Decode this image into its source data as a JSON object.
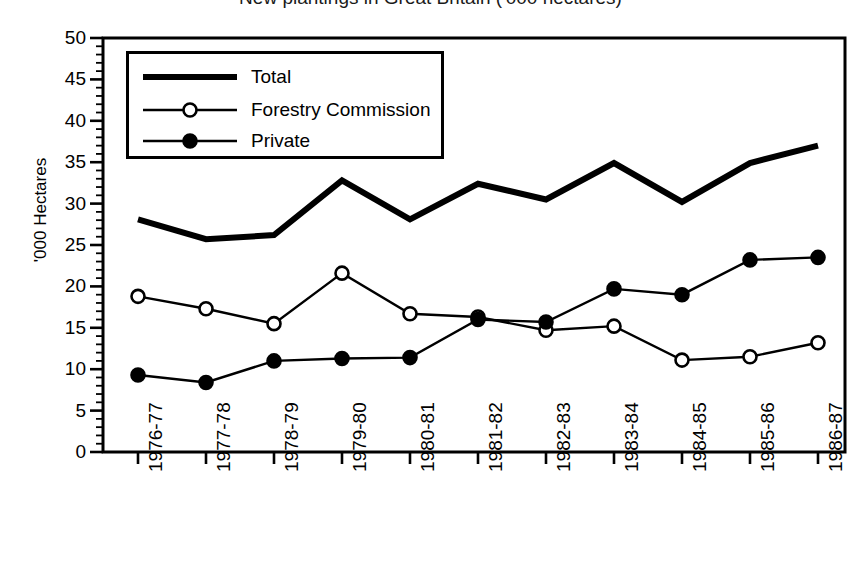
{
  "chart_data": {
    "type": "line",
    "title": "New plantings in Great Britain ('000 hectares)",
    "xlabel": "",
    "ylabel": "'000 Hectares",
    "categories": [
      "1976-77",
      "1977-78",
      "1978-79",
      "1979-80",
      "1980-81",
      "1981-82",
      "1982-83",
      "1983-84",
      "1984-85",
      "1985-86",
      "1986-87"
    ],
    "series": [
      {
        "name": "Total",
        "marker": "none",
        "line": "thick",
        "values": [
          28.1,
          25.7,
          26.2,
          32.8,
          28.1,
          32.4,
          30.5,
          34.9,
          30.2,
          34.9,
          37.0
        ]
      },
      {
        "name": "Forestry Commission",
        "marker": "open-circle",
        "line": "thin",
        "values": [
          18.8,
          17.3,
          15.5,
          21.6,
          16.7,
          16.3,
          14.7,
          15.2,
          11.1,
          11.5,
          13.2
        ]
      },
      {
        "name": "Private",
        "marker": "filled-circle",
        "line": "thin",
        "values": [
          9.3,
          8.4,
          11.0,
          11.3,
          11.4,
          16.0,
          15.7,
          19.7,
          19.0,
          23.2,
          23.5
        ]
      }
    ],
    "ylim": [
      0,
      50
    ],
    "y_ticks": [
      0,
      5,
      10,
      15,
      20,
      25,
      30,
      35,
      40,
      45,
      50
    ],
    "y_minor_tick_step": 1,
    "grid": false,
    "legend_position": "top-left",
    "line_color": "#000000",
    "background_color": "#ffffff"
  },
  "legend": {
    "entries": [
      {
        "label": "Total"
      },
      {
        "label": "Forestry Commission"
      },
      {
        "label": "Private"
      }
    ]
  }
}
